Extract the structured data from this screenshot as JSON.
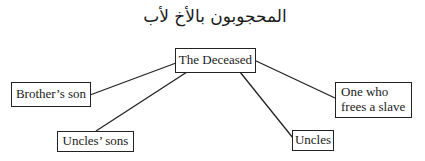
{
  "title": "المحجوبون بالأخ لأب",
  "root": {
    "id": "deceased",
    "label": "The Deceased"
  },
  "nodes": [
    {
      "id": "brothers_son",
      "label": "Brother’s son"
    },
    {
      "id": "uncles_sons",
      "label": "Uncles’ sons"
    },
    {
      "id": "uncles",
      "label": "Uncles"
    },
    {
      "id": "freer",
      "label_line1": "One who",
      "label_line2": "frees a slave"
    }
  ],
  "edges": [
    {
      "from": "deceased",
      "to": "brothers_son"
    },
    {
      "from": "deceased",
      "to": "uncles_sons"
    },
    {
      "from": "deceased",
      "to": "uncles"
    },
    {
      "from": "deceased",
      "to": "freer"
    }
  ]
}
